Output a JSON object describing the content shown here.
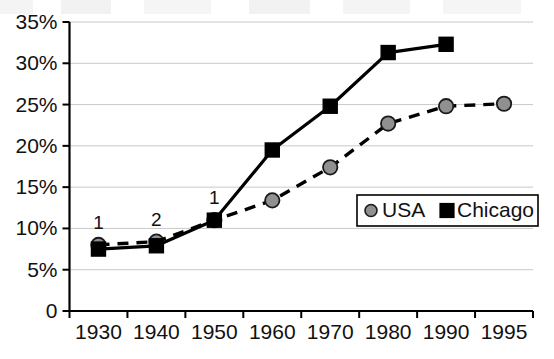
{
  "chart_data": {
    "type": "line",
    "title": "",
    "xlabel": "",
    "ylabel": "",
    "categories": [
      "1930",
      "1940",
      "1950",
      "1960",
      "1970",
      "1980",
      "1990",
      "1995"
    ],
    "ylim": [
      0,
      35
    ],
    "ytick_labels": [
      "0",
      "5%",
      "10%",
      "15%",
      "20%",
      "25%",
      "30%",
      "35%"
    ],
    "ytick_values": [
      0,
      5,
      10,
      15,
      20,
      25,
      30,
      35
    ],
    "grid": true,
    "legend_position": "inside-right",
    "series": [
      {
        "name": "USA",
        "marker": "circle",
        "marker_color": "#909090",
        "line_color": "#000000",
        "line_style": "dashed",
        "values": [
          8.0,
          8.4,
          11.0,
          13.4,
          17.4,
          22.7,
          24.8,
          25.1
        ]
      },
      {
        "name": "Chicago",
        "marker": "square",
        "marker_color": "#000000",
        "line_color": "#000000",
        "line_style": "solid",
        "values": [
          7.5,
          7.9,
          11.0,
          19.5,
          24.8,
          31.3,
          32.3,
          null
        ]
      }
    ],
    "annotations": [
      {
        "text": "1",
        "category": "1930",
        "value": 8.0
      },
      {
        "text": "2",
        "category": "1940",
        "value": 8.4
      },
      {
        "text": "1",
        "category": "1950",
        "value": 11.0
      }
    ]
  },
  "legend": {
    "entries": [
      {
        "label": "USA",
        "marker": "circle-marker"
      },
      {
        "label": "Chicago",
        "marker": "square-marker"
      }
    ]
  }
}
